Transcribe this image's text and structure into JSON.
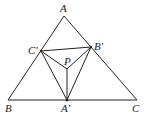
{
  "diagram": {
    "stroke_color": "#222222",
    "points": {
      "A": {
        "label": "A",
        "x": 64,
        "y": 16
      },
      "B": {
        "label": "B",
        "x": 8,
        "y": 100
      },
      "C": {
        "label": "C",
        "x": 137,
        "y": 100
      },
      "A1": {
        "label": "A′",
        "x": 67,
        "y": 100
      },
      "B1": {
        "label": "B′",
        "x": 91,
        "y": 47
      },
      "C1": {
        "label": "C′",
        "x": 41,
        "y": 51
      },
      "P": {
        "label": "P",
        "x": 67,
        "y": 69
      }
    },
    "segments": [
      [
        "A",
        "B"
      ],
      [
        "B",
        "C"
      ],
      [
        "C",
        "A"
      ],
      [
        "C1",
        "B1"
      ],
      [
        "B1",
        "A1"
      ],
      [
        "A1",
        "C1"
      ],
      [
        "P",
        "A1"
      ],
      [
        "P",
        "B1"
      ],
      [
        "P",
        "C1"
      ]
    ]
  }
}
